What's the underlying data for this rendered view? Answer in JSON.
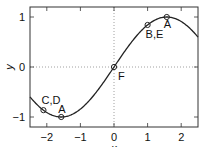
{
  "chart_data": {
    "type": "line",
    "title": "",
    "panel_label_partial": true,
    "xlabel": "x",
    "ylabel": "y",
    "xlim": [
      -2.5,
      2.5
    ],
    "ylim": [
      -1.2,
      1.2
    ],
    "xticks": [
      -2,
      -1,
      0,
      1,
      2
    ],
    "yticks": [
      -1,
      0,
      1
    ],
    "xtick_labels": [
      "−2",
      "−1",
      "0",
      "1",
      "2"
    ],
    "ytick_labels": [
      "−1",
      "0",
      "1"
    ],
    "grid": "dotted zero lines only (x=0, y=0)",
    "legend": null,
    "series": [
      {
        "name": "y = sin(x)",
        "function": "sin(x)",
        "color": "#222222",
        "x": [
          -2.5,
          -2.0,
          -1.5708,
          -1.0,
          -0.5,
          0.0,
          0.5,
          1.0,
          1.5708,
          2.0,
          2.5
        ],
        "y": [
          -0.598,
          -0.909,
          -1.0,
          -0.841,
          -0.479,
          0.0,
          0.479,
          0.841,
          1.0,
          0.909,
          0.598
        ]
      }
    ],
    "marked_points": [
      {
        "label": "A",
        "x": 1.5708,
        "y": 1.0
      },
      {
        "label": "B,E",
        "x": 1.0,
        "y": 0.841
      },
      {
        "label": "F",
        "x": 0.0,
        "y": 0.0
      },
      {
        "label": "A",
        "x": -1.5708,
        "y": -1.0
      },
      {
        "label": "C,D",
        "x": -2.1,
        "y": -0.863
      }
    ]
  },
  "colors": {
    "curve": "#222222",
    "frame": "#333333",
    "zero_lines": "#888888",
    "background": "#ffffff"
  }
}
